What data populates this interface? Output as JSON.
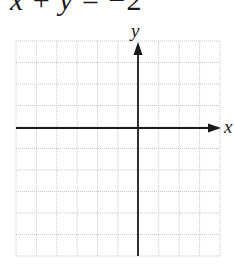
{
  "equation": {
    "lhs_x": "x",
    "plus": "+",
    "lhs_y": "y",
    "equals": "=",
    "rhs": "−2"
  },
  "graph": {
    "x_axis_label": "x",
    "y_axis_label": "y",
    "grid_columns": 10,
    "grid_rows": 10,
    "y_axis_column": 6,
    "x_axis_row": 4,
    "grid_color": "#c8c8c8",
    "axis_color": "#1a1a1a"
  }
}
